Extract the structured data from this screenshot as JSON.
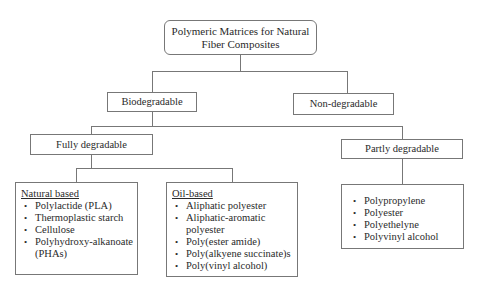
{
  "root": {
    "label_line1": "Polymeric Matrices for Natural",
    "label_line2": "Fiber Composites"
  },
  "level1": {
    "biodegradable": "Biodegradable",
    "non_degradable": "Non-degradable"
  },
  "level2": {
    "fully_degradable": "Fully degradable",
    "partly_degradable": "Partly degradable"
  },
  "natural_based": {
    "heading": "Natural based",
    "items": [
      "Polylactide (PLA)",
      "Thermoplastic starch",
      "Cellulose",
      "Polyhydroxy-alkanoate (PHAs)"
    ]
  },
  "oil_based": {
    "heading": "Oil-based",
    "items": [
      "Aliphatic polyester",
      "Aliphatic-aromatic polyester",
      "Poly(ester amide)",
      "Poly(alkyene succinate)s",
      "Poly(vinyl alcohol)"
    ]
  },
  "partly_list": {
    "items": [
      "Polypropylene",
      "Polyester",
      "Polyethelyne",
      "Polyvinyl alcohol"
    ]
  },
  "colors": {
    "line": "#777777",
    "text": "#2a2a2a",
    "background": "#ffffff"
  }
}
